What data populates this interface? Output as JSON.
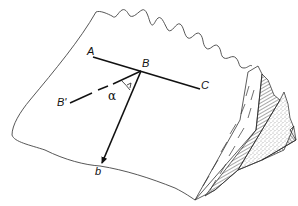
{
  "figure": {
    "type": "geological block diagram",
    "labels": {
      "A": "A",
      "B": "B",
      "C": "C",
      "B_prime": "B'",
      "alpha": "α",
      "b": "b"
    },
    "colors": {
      "line": "#111111",
      "outline": "#444444",
      "background": "#ffffff"
    }
  }
}
